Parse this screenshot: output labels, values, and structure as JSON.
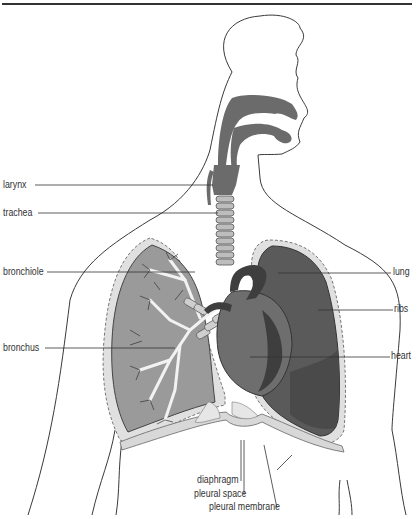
{
  "diagram": {
    "colors": {
      "outline": "#3a3a3a",
      "airway": "#6b6b6b",
      "lung_left_fill": "#9a9a9a",
      "lung_right_fill": "#5a5a5a",
      "pleura": "#d8d8d8",
      "heart": "#4a4a4a",
      "leader_line": "#333333"
    },
    "labels_left": [
      {
        "text": "larynx"
      },
      {
        "text": "trachea"
      },
      {
        "text": "bronchiole"
      },
      {
        "text": "bronchus"
      }
    ],
    "labels_right": [
      {
        "text": "lung"
      },
      {
        "text": "ribs"
      },
      {
        "text": "heart"
      }
    ],
    "labels_bottom": [
      {
        "text": "diaphragm"
      },
      {
        "text": "pleural space"
      },
      {
        "text": "pleural membrane"
      }
    ]
  }
}
